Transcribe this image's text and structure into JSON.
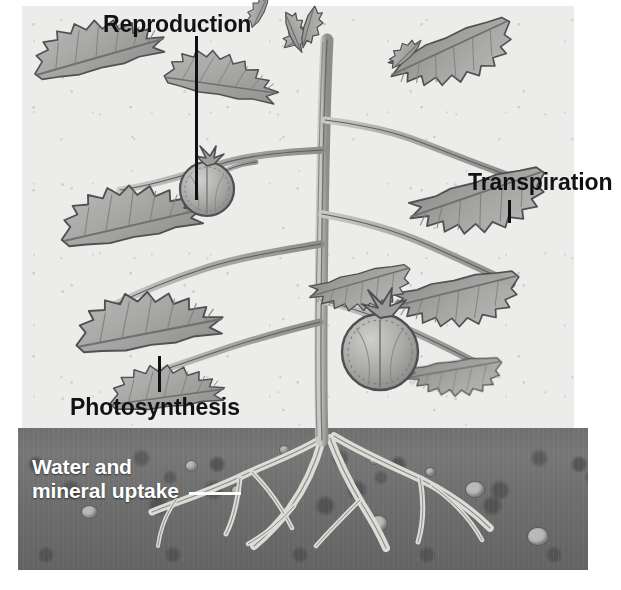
{
  "figure": {
    "style": "grayscale botanical illustration",
    "background_color": "#ececeb",
    "soil_color": "#6f6f70",
    "label_color": "#121212",
    "label_color_on_soil": "#ffffff"
  },
  "labels": [
    {
      "id": "reproduction",
      "text": "Reproduction",
      "color": "#121212",
      "leader": "vertical-line-down",
      "points_to": "tomato-fruit-upper"
    },
    {
      "id": "transpiration",
      "text": "Transpiration",
      "color": "#121212",
      "leader": "vertical-tick-down",
      "points_to": "leaf-right"
    },
    {
      "id": "photosynthesis",
      "text": "Photosynthesis",
      "color": "#121212",
      "leader": "vertical-tick-up",
      "points_to": "leaf-lower-left"
    },
    {
      "id": "water-mineral-uptake",
      "text_line_1": "Water and",
      "text_line_2": "mineral uptake",
      "color": "#ffffff",
      "leader": "horizontal-line-right",
      "points_to": "root-system"
    }
  ],
  "plant": {
    "type": "tomato plant",
    "parts": [
      "growing tip",
      "main stem",
      "branch stems",
      "compound serrated leaves",
      "tomato fruits",
      "root system"
    ],
    "fruit_count": 2,
    "fruits": [
      {
        "id": "tomato-fruit-upper",
        "cx": 207,
        "cy": 189,
        "r": 27
      },
      {
        "id": "tomato-fruit-lower",
        "cx": 380,
        "cy": 352,
        "r": 38
      }
    ]
  },
  "soil": {
    "label": "soil cross-section",
    "pebbles": 9,
    "surface_line_y": 436
  }
}
